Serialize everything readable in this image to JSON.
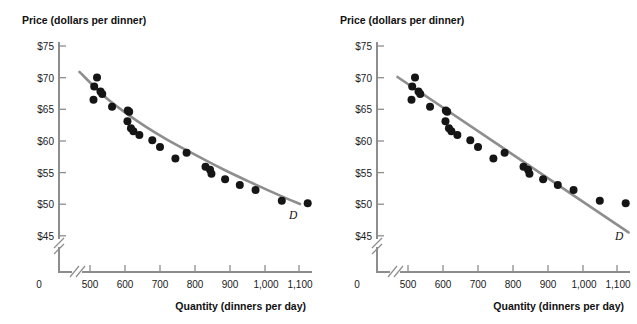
{
  "figure": {
    "background": "#ffffff",
    "point_color": "#151515",
    "line_color": "#8e8e8e",
    "axis_color": "#8d8d8d"
  },
  "panels": [
    {
      "id": "panel-a",
      "name": "left-panel",
      "fit_type": "curve",
      "curve_label": "D",
      "axes": {
        "ylabel": "Price (dollars per dinner)",
        "xlabel": "Quantity (dinners per day)",
        "yticks": [
          "$75",
          "$70",
          "$65",
          "$60",
          "$55",
          "$50",
          "$45"
        ],
        "ytick_values": [
          75,
          70,
          65,
          60,
          55,
          50,
          45
        ],
        "xticks": [
          "0",
          "500",
          "600",
          "700",
          "800",
          "900",
          "1,000",
          "1,100"
        ],
        "xtick_values": [
          0,
          500,
          600,
          700,
          800,
          900,
          1000,
          1100
        ],
        "x_break": true,
        "y_break": true
      }
    },
    {
      "id": "panel-b",
      "name": "right-panel",
      "fit_type": "line",
      "curve_label": "D",
      "axes": {
        "ylabel": "Price (dollars per dinner)",
        "xlabel": "Quantity (dinners per day)",
        "yticks": [
          "$75",
          "$70",
          "$65",
          "$60",
          "$55",
          "$50",
          "$45"
        ],
        "ytick_values": [
          75,
          70,
          65,
          60,
          55,
          50,
          45
        ],
        "xticks": [
          "0",
          "500",
          "600",
          "700",
          "800",
          "900",
          "1,000",
          "1,100"
        ],
        "xtick_values": [
          0,
          500,
          600,
          700,
          800,
          900,
          1000,
          1100
        ],
        "x_break": true,
        "y_break": true
      }
    }
  ],
  "chart_data": {
    "type": "scatter",
    "title": "",
    "xlabel": "Quantity (dinners per day)",
    "ylabel": "Price (dollars per dinner)",
    "xlim": [
      460,
      1140
    ],
    "ylim": [
      43,
      76
    ],
    "grid": false,
    "legend": "none",
    "x_axis_break_after": 0,
    "y_axis_break_below": 45,
    "series": [
      {
        "name": "Observed price-quantity pairs (panel a)",
        "type": "scatter",
        "marker": "filled-circle",
        "color": "#151515",
        "points": [
          {
            "q": 520,
            "p": 70.0
          },
          {
            "q": 512,
            "p": 68.6
          },
          {
            "q": 510,
            "p": 66.5
          },
          {
            "q": 530,
            "p": 67.8
          },
          {
            "q": 535,
            "p": 67.4
          },
          {
            "q": 563,
            "p": 65.4
          },
          {
            "q": 608,
            "p": 64.8
          },
          {
            "q": 612,
            "p": 64.6
          },
          {
            "q": 607,
            "p": 63.1
          },
          {
            "q": 617,
            "p": 62.0
          },
          {
            "q": 624,
            "p": 61.5
          },
          {
            "q": 641,
            "p": 60.9
          },
          {
            "q": 678,
            "p": 60.1
          },
          {
            "q": 700,
            "p": 59.0
          },
          {
            "q": 744,
            "p": 57.2
          },
          {
            "q": 776,
            "p": 58.1
          },
          {
            "q": 830,
            "p": 55.9
          },
          {
            "q": 843,
            "p": 55.4
          },
          {
            "q": 847,
            "p": 54.8
          },
          {
            "q": 886,
            "p": 53.9
          },
          {
            "q": 928,
            "p": 53.0
          },
          {
            "q": 973,
            "p": 52.2
          },
          {
            "q": 1048,
            "p": 50.5
          },
          {
            "q": 1122,
            "p": 50.1
          }
        ]
      },
      {
        "name": "Fitted demand curve (panel a)",
        "type": "curve",
        "color": "#8e8e8e",
        "label": "D",
        "path_points": [
          {
            "q": 470,
            "p": 70.9
          },
          {
            "q": 540,
            "p": 67.1
          },
          {
            "q": 600,
            "p": 64.5
          },
          {
            "q": 660,
            "p": 62.2
          },
          {
            "q": 720,
            "p": 60.2
          },
          {
            "q": 800,
            "p": 57.8
          },
          {
            "q": 880,
            "p": 55.5
          },
          {
            "q": 960,
            "p": 53.4
          },
          {
            "q": 1040,
            "p": 51.4
          },
          {
            "q": 1100,
            "p": 50.0
          }
        ]
      },
      {
        "name": "Fitted demand line (panel b)",
        "type": "line",
        "color": "#8e8e8e",
        "label": "D",
        "endpoints": [
          {
            "q": 470,
            "p": 70.1
          },
          {
            "q": 1130,
            "p": 45.5
          }
        ]
      }
    ]
  }
}
